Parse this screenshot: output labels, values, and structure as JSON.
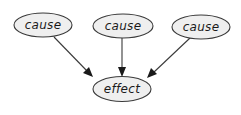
{
  "diagram": {
    "type": "directed-graph",
    "colors": {
      "node_fill": "#efefef",
      "node_stroke": "#3a3a3a",
      "edge": "#3a3a3a",
      "text": "#1a1a1a"
    },
    "nodes": [
      {
        "id": "cause1",
        "label": "cause",
        "cx": 43,
        "cy": 25,
        "rx": 29,
        "ry": 12
      },
      {
        "id": "cause2",
        "label": "cause",
        "cx": 123,
        "cy": 26,
        "rx": 30,
        "ry": 12
      },
      {
        "id": "cause3",
        "label": "cause",
        "cx": 201,
        "cy": 27,
        "rx": 29,
        "ry": 12
      },
      {
        "id": "effect",
        "label": "effect",
        "cx": 122,
        "cy": 89,
        "rx": 29,
        "ry": 12.5
      }
    ],
    "edges": [
      {
        "from": "cause1",
        "to": "effect"
      },
      {
        "from": "cause2",
        "to": "effect"
      },
      {
        "from": "cause3",
        "to": "effect"
      }
    ]
  }
}
